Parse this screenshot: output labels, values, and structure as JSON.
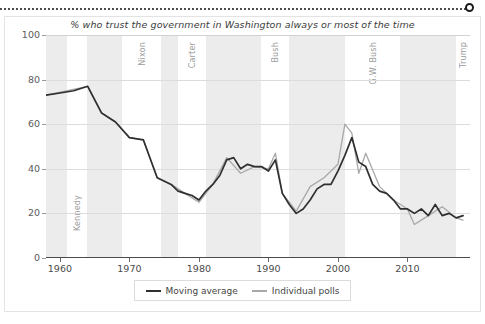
{
  "figure": {
    "title": "% who trust the government in Washington always or most of the time"
  },
  "legend": {
    "items": [
      {
        "label": "Moving average",
        "color": "#2f2f2f"
      },
      {
        "label": "Individual polls",
        "color": "#a8a8a8"
      }
    ]
  },
  "colors": {
    "moving_average": "#2f2f2f",
    "individual_polls": "#a8a8a8",
    "band": "#ececec",
    "grid": "#dcdcdc",
    "axis": "#4a4a4a",
    "president_label": "#9b9b9b"
  },
  "presidents": [
    {
      "name": "Eisenhower",
      "start": 1958.0,
      "end": 1961.0,
      "shaded": true,
      "position": "bottom"
    },
    {
      "name": "Kennedy",
      "start": 1961.0,
      "end": 1963.9,
      "shaded": false,
      "position": "bottom"
    },
    {
      "name": "Johnson",
      "start": 1963.9,
      "end": 1969.0,
      "shaded": true,
      "position": "bottom"
    },
    {
      "name": "Nixon",
      "start": 1969.0,
      "end": 1974.6,
      "shaded": false,
      "position": "top"
    },
    {
      "name": "Ford",
      "start": 1974.6,
      "end": 1977.0,
      "shaded": true,
      "position": "top"
    },
    {
      "name": "Carter",
      "start": 1977.0,
      "end": 1981.0,
      "shaded": false,
      "position": "top"
    },
    {
      "name": "Reagan",
      "start": 1981.0,
      "end": 1989.0,
      "shaded": true,
      "position": "top"
    },
    {
      "name": "Bush",
      "start": 1989.0,
      "end": 1993.0,
      "shaded": false,
      "position": "top"
    },
    {
      "name": "Clinton",
      "start": 1993.0,
      "end": 2001.0,
      "shaded": true,
      "position": "top"
    },
    {
      "name": "G.W. Bush",
      "start": 2001.0,
      "end": 2009.0,
      "shaded": false,
      "position": "top"
    },
    {
      "name": "Obama",
      "start": 2009.0,
      "end": 2017.0,
      "shaded": true,
      "position": "top"
    },
    {
      "name": "Trump",
      "start": 2017.0,
      "end": 2019.0,
      "shaded": false,
      "position": "top"
    }
  ],
  "chart_data": {
    "type": "line",
    "title": "% who trust the government in Washington always or most of the time",
    "xlabel": "",
    "ylabel": "",
    "xlim": [
      1958,
      2019
    ],
    "ylim": [
      0,
      100
    ],
    "xticks": [
      1960,
      1970,
      1980,
      1990,
      2000,
      2010
    ],
    "yticks": [
      0,
      20,
      40,
      60,
      80,
      100
    ],
    "grid": true,
    "legend_position": "bottom",
    "series": [
      {
        "name": "Moving average",
        "color": "#2f2f2f",
        "x": [
          1958,
          1960,
          1962,
          1964,
          1966,
          1968,
          1970,
          1972,
          1974,
          1976,
          1977,
          1978,
          1979,
          1980,
          1981,
          1982,
          1983,
          1984,
          1985,
          1986,
          1987,
          1988,
          1989,
          1990,
          1991,
          1992,
          1993,
          1994,
          1995,
          1996,
          1997,
          1998,
          1999,
          2000,
          2001,
          2002,
          2003,
          2004,
          2005,
          2006,
          2007,
          2008,
          2009,
          2010,
          2011,
          2012,
          2013,
          2014,
          2015,
          2016,
          2017,
          2018
        ],
        "y": [
          73,
          74,
          75,
          77,
          65,
          61,
          54,
          53,
          36,
          33,
          30,
          29,
          28,
          26,
          30,
          33,
          37,
          44,
          45,
          40,
          42,
          41,
          41,
          39,
          44,
          29,
          24,
          20,
          22,
          26,
          31,
          33,
          33,
          39,
          46,
          54,
          43,
          41,
          33,
          30,
          29,
          26,
          22,
          22,
          20,
          22,
          19,
          24,
          19,
          20,
          18,
          19
        ]
      },
      {
        "name": "Individual polls",
        "color": "#a8a8a8",
        "x": [
          1958,
          1964,
          1966,
          1968,
          1970,
          1972,
          1974,
          1976,
          1978,
          1980,
          1982,
          1984,
          1986,
          1988,
          1990,
          1991,
          1992,
          1994,
          1996,
          1998,
          2000,
          2001,
          2002,
          2003,
          2004,
          2006,
          2008,
          2010,
          2011,
          2013,
          2015,
          2017,
          2018
        ],
        "y": [
          73,
          77,
          65,
          61,
          54,
          53,
          36,
          33,
          29,
          25,
          33,
          45,
          38,
          41,
          40,
          47,
          29,
          21,
          32,
          36,
          42,
          60,
          56,
          38,
          47,
          32,
          26,
          22,
          15,
          19,
          23,
          18,
          17
        ]
      }
    ],
    "annotations": [
      {
        "label": "peak trust",
        "x": 1964,
        "y": 77
      },
      {
        "label": "post-9/11 spike",
        "x": 2002,
        "y": 54
      },
      {
        "label": "mid-1990s low",
        "x": 1994,
        "y": 20
      }
    ]
  },
  "axis_labels": {
    "y": [
      "100",
      "80",
      "60",
      "40",
      "20",
      "0"
    ],
    "x": [
      "1960",
      "1970",
      "1980",
      "1990",
      "2000",
      "2010"
    ]
  }
}
